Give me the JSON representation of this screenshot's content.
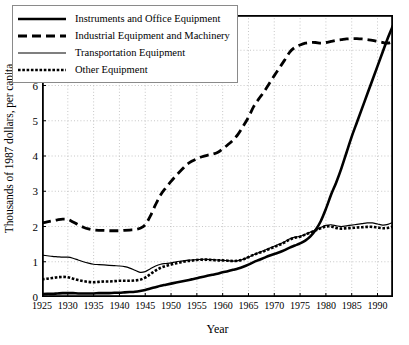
{
  "chart_data": {
    "type": "line",
    "title": "",
    "xlabel": "Year",
    "ylabel": "Thousands of 1987 dollars, per capita",
    "xlim": [
      1925,
      1993
    ],
    "ylim": [
      0,
      8
    ],
    "xticks": [
      1925,
      1930,
      1935,
      1940,
      1945,
      1950,
      1955,
      1960,
      1965,
      1970,
      1975,
      1980,
      1985,
      1990
    ],
    "yticks": [
      0,
      1,
      2,
      3,
      4,
      5,
      6,
      7,
      8
    ],
    "grid": "dotted-both",
    "legend_position": "top-left",
    "x": [
      1925,
      1926,
      1927,
      1928,
      1929,
      1930,
      1931,
      1932,
      1933,
      1934,
      1935,
      1936,
      1937,
      1938,
      1939,
      1940,
      1941,
      1942,
      1943,
      1944,
      1945,
      1946,
      1947,
      1948,
      1949,
      1950,
      1951,
      1952,
      1953,
      1954,
      1955,
      1956,
      1957,
      1958,
      1959,
      1960,
      1961,
      1962,
      1963,
      1964,
      1965,
      1966,
      1967,
      1968,
      1969,
      1970,
      1971,
      1972,
      1973,
      1974,
      1975,
      1976,
      1977,
      1978,
      1979,
      1980,
      1981,
      1982,
      1983,
      1984,
      1985,
      1986,
      1987,
      1988,
      1989,
      1990,
      1991,
      1992,
      1993
    ],
    "series": [
      {
        "name": "Instruments and Office Equipment",
        "style": "solid-thick",
        "color": "#000000",
        "values": [
          0.08,
          0.09,
          0.09,
          0.1,
          0.11,
          0.11,
          0.11,
          0.1,
          0.1,
          0.1,
          0.1,
          0.11,
          0.11,
          0.11,
          0.12,
          0.12,
          0.13,
          0.14,
          0.15,
          0.17,
          0.2,
          0.24,
          0.28,
          0.32,
          0.35,
          0.38,
          0.41,
          0.44,
          0.47,
          0.5,
          0.53,
          0.57,
          0.6,
          0.63,
          0.66,
          0.7,
          0.73,
          0.77,
          0.81,
          0.86,
          0.92,
          0.99,
          1.05,
          1.11,
          1.17,
          1.22,
          1.27,
          1.33,
          1.4,
          1.46,
          1.52,
          1.6,
          1.72,
          1.9,
          2.15,
          2.5,
          2.9,
          3.25,
          3.65,
          4.1,
          4.55,
          4.95,
          5.35,
          5.75,
          6.15,
          6.55,
          6.95,
          7.35,
          7.7
        ]
      },
      {
        "name": "Industrial Equipment and Machinery",
        "style": "dashed",
        "color": "#000000",
        "values": [
          2.1,
          2.13,
          2.16,
          2.19,
          2.21,
          2.2,
          2.13,
          2.05,
          1.98,
          1.93,
          1.9,
          1.89,
          1.89,
          1.88,
          1.88,
          1.88,
          1.89,
          1.9,
          1.91,
          1.95,
          2.05,
          2.3,
          2.62,
          2.9,
          3.1,
          3.28,
          3.45,
          3.6,
          3.75,
          3.85,
          3.92,
          3.98,
          4.02,
          4.05,
          4.1,
          4.2,
          4.32,
          4.45,
          4.62,
          4.85,
          5.1,
          5.4,
          5.62,
          5.82,
          6.05,
          6.28,
          6.5,
          6.72,
          6.95,
          7.08,
          7.15,
          7.2,
          7.22,
          7.22,
          7.2,
          7.22,
          7.25,
          7.28,
          7.3,
          7.32,
          7.33,
          7.33,
          7.32,
          7.3,
          7.28,
          7.25,
          7.22,
          7.2,
          7.25
        ]
      },
      {
        "name": "Transportation Equipment",
        "style": "solid-thin",
        "color": "#000000",
        "values": [
          1.19,
          1.17,
          1.15,
          1.14,
          1.13,
          1.13,
          1.1,
          1.05,
          1.0,
          0.96,
          0.93,
          0.92,
          0.91,
          0.9,
          0.89,
          0.88,
          0.86,
          0.82,
          0.76,
          0.7,
          0.72,
          0.8,
          0.88,
          0.93,
          0.95,
          0.97,
          1.0,
          1.02,
          1.04,
          1.05,
          1.06,
          1.07,
          1.07,
          1.06,
          1.05,
          1.04,
          1.03,
          1.02,
          1.03,
          1.07,
          1.13,
          1.2,
          1.26,
          1.32,
          1.38,
          1.44,
          1.5,
          1.57,
          1.65,
          1.7,
          1.72,
          1.78,
          1.84,
          1.9,
          1.97,
          2.03,
          2.05,
          2.02,
          2.0,
          2.02,
          2.04,
          2.06,
          2.08,
          2.1,
          2.1,
          2.07,
          2.04,
          2.06,
          2.12
        ]
      },
      {
        "name": "Other Equipment",
        "style": "dotted-thick",
        "color": "#000000",
        "values": [
          0.5,
          0.52,
          0.54,
          0.56,
          0.57,
          0.56,
          0.52,
          0.48,
          0.45,
          0.43,
          0.42,
          0.43,
          0.44,
          0.44,
          0.45,
          0.46,
          0.46,
          0.46,
          0.47,
          0.49,
          0.55,
          0.65,
          0.75,
          0.83,
          0.88,
          0.92,
          0.96,
          0.99,
          1.02,
          1.03,
          1.05,
          1.06,
          1.06,
          1.05,
          1.04,
          1.04,
          1.03,
          1.02,
          1.03,
          1.07,
          1.13,
          1.2,
          1.25,
          1.3,
          1.36,
          1.42,
          1.48,
          1.55,
          1.63,
          1.68,
          1.71,
          1.77,
          1.83,
          1.89,
          1.95,
          2.0,
          2.0,
          1.96,
          1.94,
          1.95,
          1.96,
          1.97,
          1.98,
          1.99,
          1.99,
          1.97,
          1.95,
          1.96,
          2.0
        ]
      }
    ]
  },
  "legend": {
    "items": [
      {
        "label": "Instruments and Office Equipment",
        "style": "solid-thick"
      },
      {
        "label": "Industrial Equipment and Machinery",
        "style": "dashed"
      },
      {
        "label": "Transportation Equipment",
        "style": "solid-thin"
      },
      {
        "label": "Other Equipment",
        "style": "dotted-thick"
      }
    ]
  },
  "colors": {
    "line": "#000000",
    "grid": "#b9b9b9",
    "frame": "#000000",
    "background": "#ffffff"
  }
}
